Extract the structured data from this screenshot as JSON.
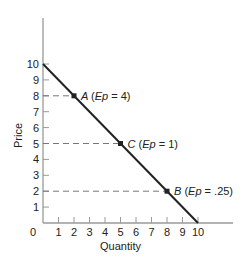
{
  "chart_data": {
    "type": "line",
    "title": "",
    "xlabel": "Quantity",
    "ylabel": "Price",
    "xlim": [
      0,
      10
    ],
    "ylim": [
      0,
      10
    ],
    "grid": false,
    "x_ticks": [
      "0",
      "1",
      "2",
      "3",
      "4",
      "5",
      "6",
      "7",
      "8",
      "9",
      "10"
    ],
    "y_ticks": [
      "1",
      "2",
      "3",
      "4",
      "5",
      "6",
      "7",
      "8",
      "9",
      "10"
    ],
    "series": [
      {
        "name": "Demand",
        "x": [
          0,
          10
        ],
        "y": [
          10,
          0
        ]
      }
    ],
    "points": [
      {
        "label": "A",
        "x": 2,
        "y": 8,
        "annotation_prefix": "(",
        "ep_label": "Ep",
        "eq": " = ",
        "ep_value": "4",
        "suffix": ")"
      },
      {
        "label": "C",
        "x": 5,
        "y": 5,
        "annotation_prefix": "(",
        "ep_label": "Ep",
        "eq": " = ",
        "ep_value": "1",
        "suffix": ")"
      },
      {
        "label": "B",
        "x": 8,
        "y": 2,
        "annotation_prefix": "(",
        "ep_label": "Ep",
        "eq": " = ",
        "ep_value": ".25",
        "suffix": ")"
      }
    ],
    "reference_lines": [
      {
        "type": "horizontal-dashed",
        "y": 8,
        "x_to": 2
      },
      {
        "type": "horizontal-dashed",
        "y": 5,
        "x_to": 5
      },
      {
        "type": "horizontal-dashed",
        "y": 2,
        "x_to": 8
      }
    ]
  },
  "colors": {
    "axis": "#9a9a9a",
    "line": "#222222",
    "dash": "#777777",
    "text": "#222222"
  }
}
